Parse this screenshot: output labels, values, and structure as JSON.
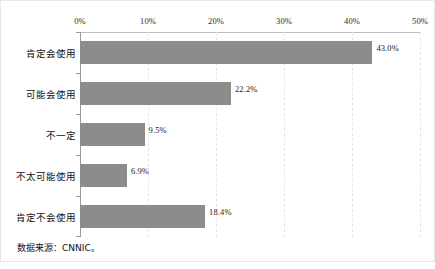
{
  "chart_data": {
    "type": "bar",
    "orientation": "horizontal",
    "title": "",
    "subtitle": "",
    "xlabel": "",
    "ylabel": "",
    "categories": [
      "肯定会使用",
      "可能会使用",
      "不一定",
      "不太可能使用",
      "肯定不会使用"
    ],
    "values": [
      43.0,
      22.2,
      9.5,
      6.9,
      18.4
    ],
    "value_labels": [
      "43.0%",
      "22.2%",
      "9.5%",
      "6.9%",
      "18.4%"
    ],
    "xlim": [
      0,
      50
    ],
    "xticks": [
      0,
      10,
      20,
      30,
      40,
      50
    ],
    "xtick_labels": [
      "0%",
      "10%",
      "20%",
      "30%",
      "40%",
      "50%"
    ],
    "xaxis_position": "top",
    "grid": "vertical-dashed",
    "legend": "none",
    "series": [
      {
        "name": "占比",
        "values": [
          43.0,
          22.2,
          9.5,
          6.9,
          18.4
        ],
        "color": "#8c8c8c"
      }
    ],
    "annotations": {
      "source": "数据来源：CNNIC。"
    }
  },
  "colors": {
    "bar": "#8c8c8c",
    "gridline": "#ebe3e3",
    "axis": "#9a9a9a",
    "frame": "#e8e8e8",
    "text": "#111111"
  }
}
